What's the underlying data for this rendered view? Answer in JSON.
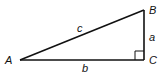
{
  "diagram": {
    "type": "right-triangle",
    "stroke_color": "#111111",
    "background": "#ffffff",
    "vertices": {
      "A": {
        "label": "A",
        "x": 20,
        "y": 60
      },
      "B": {
        "label": "B",
        "x": 144,
        "y": 10
      },
      "C": {
        "label": "C",
        "x": 144,
        "y": 60
      }
    },
    "sides": {
      "a": {
        "label": "a",
        "between": [
          "B",
          "C"
        ]
      },
      "b": {
        "label": "b",
        "between": [
          "A",
          "C"
        ]
      },
      "c": {
        "label": "c",
        "between": [
          "A",
          "B"
        ],
        "role": "hypotenuse"
      }
    },
    "right_angle_at": "C"
  }
}
